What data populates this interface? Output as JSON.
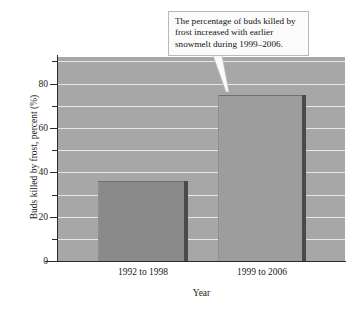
{
  "chart_data": {
    "type": "bar",
    "title": "",
    "categories": [
      "1992 to 1998",
      "1999 to 2006"
    ],
    "values": [
      36,
      75
    ],
    "series": [
      {
        "name": "Buds killed by frost",
        "values": [
          36,
          75
        ]
      }
    ],
    "xlabel": "Year",
    "ylabel": "Buds killed by frost, percent (%)",
    "ylim": [
      0,
      92
    ],
    "ytick_labels": [
      "0",
      "20",
      "40",
      "60",
      "80"
    ],
    "ytick_values": [
      0,
      20,
      40,
      60,
      80
    ],
    "yminor_values": [
      10,
      30,
      50,
      70,
      90
    ],
    "grid": true,
    "grid_values": [
      10,
      20,
      30,
      40,
      50,
      60,
      70,
      80,
      90
    ],
    "legend": "none",
    "annotations": [
      {
        "text": "The percentage of buds killed by frost increased with earlier snowmelt during 1999–2006.",
        "points_to_category": "1999 to 2006",
        "points_to_value": 75
      }
    ],
    "colors": {
      "plot_background": "#a7a7a7",
      "gridline": "#efefef",
      "bar_1_fill": "#8a8a8a",
      "bar_2_fill": "#9d9d9d",
      "bar_edge": "#4a4a4a",
      "axis": "#2b2b2b",
      "callout_background": "#fbfbfb",
      "callout_border": "#b9b9b9",
      "text": "#141414"
    }
  },
  "callout": {
    "text": "The percentage of buds killed by frost increased with earlier snowmelt during 1999–2006."
  },
  "axes": {
    "ylabel": "Buds killed by frost, percent (%)",
    "xlabel": "Year",
    "yticks": [
      {
        "label": "80",
        "value": 80
      },
      {
        "label": "60",
        "value": 60
      },
      {
        "label": "40",
        "value": 40
      },
      {
        "label": "20",
        "value": 20
      },
      {
        "label": "0",
        "value": 0
      }
    ],
    "xticks": [
      {
        "label": "1992 to 1998"
      },
      {
        "label": "1999 to 2006"
      }
    ]
  }
}
